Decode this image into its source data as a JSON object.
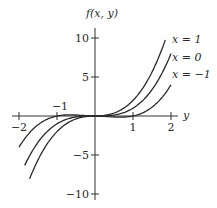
{
  "chart_data": {
    "type": "line",
    "title": "",
    "xlabel": "y",
    "ylabel": "f(x,y)",
    "xlim": [
      -2,
      2
    ],
    "ylim": [
      -10,
      10
    ],
    "x_ticks": [
      -2,
      -1,
      1,
      2
    ],
    "x_tick_labels": [
      "−2",
      "−1",
      "1",
      "2"
    ],
    "y_ticks": [
      10,
      5,
      -5,
      -10
    ],
    "y_tick_labels": [
      "10",
      "5",
      "−5",
      "−10"
    ],
    "grid": false,
    "legend_position": "inline-right",
    "function": "f(x,y) = y^3 + x*y^2",
    "x": [
      -2,
      -1.5,
      -1,
      -0.5,
      0,
      0.5,
      1,
      1.5,
      1.85,
      2
    ],
    "series": [
      {
        "name": "x = 1",
        "values": [
          -4,
          -1.125,
          0,
          0.125,
          0,
          0.375,
          2,
          5.625,
          9.76,
          12
        ]
      },
      {
        "name": "x = 0",
        "values": [
          -8,
          -3.375,
          -1,
          -0.125,
          0,
          0.125,
          1,
          3.375,
          6.33,
          8
        ]
      },
      {
        "name": "x = −1",
        "values": [
          -12,
          -5.625,
          -2,
          -0.375,
          0,
          -0.125,
          0,
          1.125,
          2.91,
          4
        ]
      }
    ],
    "annotations": [
      "x = 1",
      "x = 0",
      "x = −1"
    ]
  },
  "labels": {
    "ylabel": "f(x, y)",
    "xlabel": "y",
    "yt10": "10",
    "yt5": "5",
    "ytm5": "−5",
    "ytm10": "−10",
    "xtm2": "−2",
    "xtm1": "−1",
    "xt1": "1",
    "xt2": "2",
    "leg1": "x = 1",
    "leg0": "x = 0",
    "legm1": "x = −1"
  }
}
